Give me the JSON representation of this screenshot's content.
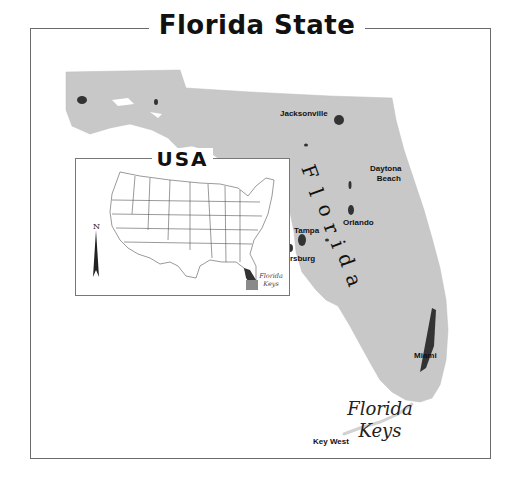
{
  "title": "Florida State",
  "main_map": {
    "state_label_letters": [
      "F",
      "l",
      "o",
      "r",
      "i",
      "d",
      "a"
    ],
    "land_color": "#c8c8c8",
    "urban_color": "#333333",
    "cities": [
      {
        "name": "Jacksonville"
      },
      {
        "name_line1": "Daytona",
        "name_line2": "Beach"
      },
      {
        "name": "Orlando"
      },
      {
        "name": "Tampa"
      },
      {
        "name_line1": "St.",
        "name_line2": "Petersburg"
      },
      {
        "name": "Miami"
      },
      {
        "name": "Key West"
      }
    ],
    "keys_label": {
      "line1": "Florida",
      "line2": "Keys"
    }
  },
  "inset": {
    "title": "USA",
    "north_arrow_label": "N",
    "keys_label": {
      "line1": "Florida",
      "line2": "Keys"
    },
    "highlight_color": "#8a8a8a"
  }
}
